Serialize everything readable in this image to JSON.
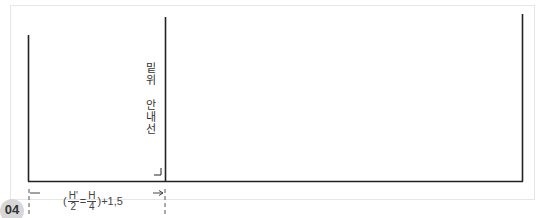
{
  "figure": {
    "badge": "04",
    "guide_label": "밑위 안내선",
    "formula": {
      "open": "(",
      "frac1_num": "H'",
      "frac1_den": "2",
      "operator": "=",
      "frac2_num": "H",
      "frac2_den": "4",
      "close": ")+1,5"
    },
    "colors": {
      "line": "#222222",
      "frame": "#e6e6e6",
      "badge_bg": "#d7d7d7",
      "text": "#444444"
    }
  }
}
